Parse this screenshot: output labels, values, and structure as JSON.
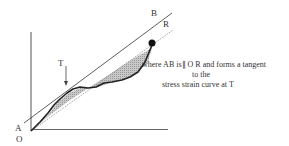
{
  "diagram": {
    "type": "stress-strain tangent modulus illustration",
    "labels": {
      "A": "A",
      "O": "O",
      "B": "B",
      "R": "R",
      "T": "T"
    },
    "caption": {
      "line1": "where  AB is∥ O R  and forms a tangent",
      "line2": "to the",
      "line3": "stress strain curve at T"
    },
    "colors": {
      "axis": "#555555",
      "curve": "#222222",
      "tangent_line": "#333333",
      "chord_line": "#888888",
      "shading": "#bdbdbd"
    }
  }
}
